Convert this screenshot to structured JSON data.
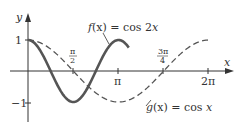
{
  "chart_data": {
    "type": "line",
    "title": "",
    "xlabel": "x",
    "ylabel": "y",
    "xlim": [
      0,
      6.6
    ],
    "ylim": [
      -1.3,
      1.5
    ],
    "grid": false,
    "x_ticks": [
      {
        "value": 1.5708,
        "label_num": "π",
        "label_den": "2",
        "position": "above"
      },
      {
        "value": 3.1416,
        "label": "π",
        "position": "below"
      },
      {
        "value": 4.7124,
        "label_num": "3π",
        "label_den": "4",
        "position": "above"
      },
      {
        "value": 6.2832,
        "label": "2π",
        "position": "below"
      }
    ],
    "y_ticks": [
      {
        "value": 1,
        "label": "1"
      },
      {
        "value": -1,
        "label": "−1"
      }
    ],
    "series": [
      {
        "name": "f(x) = cos 2x",
        "expression": "cos(2x)",
        "style": "solid",
        "color": "#555555",
        "domain": [
          0,
          3.5
        ],
        "points": [
          [
            0,
            1
          ],
          [
            0.785,
            0
          ],
          [
            1.571,
            -1
          ],
          [
            2.356,
            0
          ],
          [
            3.142,
            1
          ]
        ]
      },
      {
        "name": "g(x) = cos x",
        "expression": "cos(x)",
        "style": "dashed",
        "color": "#555555",
        "domain": [
          0,
          6.283
        ],
        "points": [
          [
            0,
            1
          ],
          [
            1.571,
            0
          ],
          [
            3.142,
            -1
          ],
          [
            4.712,
            0
          ],
          [
            6.283,
            1
          ]
        ]
      }
    ],
    "annotations": [
      {
        "text": "f(x) = cos 2x",
        "target": "f",
        "pointer": true
      },
      {
        "text": "g(x) = cos x",
        "target": "g",
        "pointer": true
      }
    ],
    "legend": null
  },
  "labels": {
    "y_axis": "y",
    "x_axis": "x",
    "y_tick_1": "1",
    "y_tick_neg1": "−1",
    "tick_pi_half_num": "π",
    "tick_pi_half_den": "2",
    "tick_pi": "π",
    "tick_3pi4_num": "3π",
    "tick_3pi4_den": "4",
    "tick_2pi": "2π",
    "f_label_name": "f",
    "f_label_rest": "(x) = cos 2",
    "f_label_x": "x",
    "g_label_name": "g",
    "g_label_rest": "(x) = cos ",
    "g_label_x": "x"
  }
}
